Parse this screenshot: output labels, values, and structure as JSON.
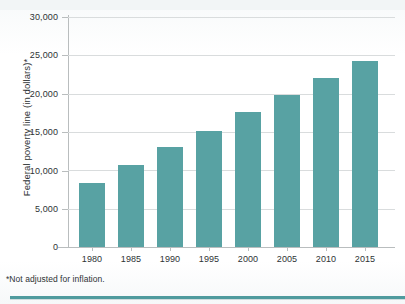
{
  "chart_data": {
    "type": "bar",
    "title": "",
    "xlabel": "",
    "ylabel": "Federal poverty line (in dollars)*",
    "categories": [
      "1980",
      "1985",
      "1990",
      "1995",
      "2000",
      "2005",
      "2010",
      "2015"
    ],
    "values": [
      8350,
      10650,
      13000,
      15150,
      17600,
      19800,
      22100,
      24250
    ],
    "ylim": [
      0,
      30000
    ],
    "ytick_labels": [
      "0",
      "5,000",
      "10,000",
      "15,000",
      "20,000",
      "25,000",
      "30,000"
    ],
    "ytick_values": [
      0,
      5000,
      10000,
      15000,
      20000,
      25000,
      30000
    ],
    "grid": true,
    "legend": "none",
    "bar_color": "#58a2a3",
    "gridline_color": "#d9dcdd",
    "axis_color": "#b9bdbe",
    "text_color": "#2e3335"
  },
  "footnote": "*Not adjusted for inflation.",
  "accent_rule_color": "#4f9b9e"
}
